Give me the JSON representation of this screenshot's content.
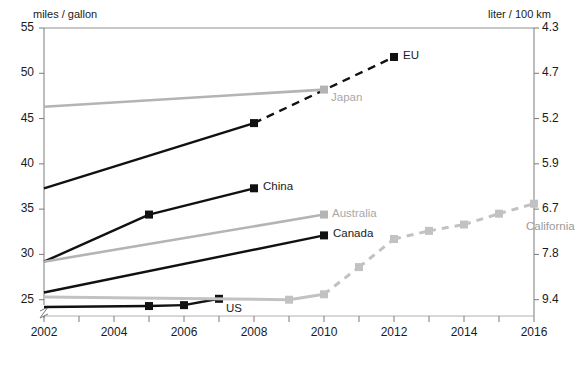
{
  "chart_data": {
    "type": "line",
    "title": "",
    "ylabel": "miles / gallon",
    "ylabel_right": "liter / 100 km",
    "xlabel": "",
    "xlim": [
      2002,
      2016
    ],
    "ylim": [
      23.2,
      55
    ],
    "grid": false,
    "legend": "inline-end-of-line labels",
    "axis_break_left": true,
    "x_ticks_major": [
      "2002",
      "2004",
      "2006",
      "2008",
      "2010",
      "2012",
      "2014",
      "2016"
    ],
    "x_ticks_minor": [
      "2003",
      "2005",
      "2007",
      "2009",
      "2011",
      "2013",
      "2015"
    ],
    "y_ticks_left": [
      "55",
      "50",
      "45",
      "40",
      "35",
      "30",
      "25"
    ],
    "y_ticks_left_values": [
      55,
      50,
      45,
      40,
      35,
      30,
      25
    ],
    "y_ticks_right": [
      "4.3",
      "4.7",
      "5.2",
      "5.9",
      "6.7",
      "7.8",
      "9.4"
    ],
    "y_ticks_right_values": [
      4.3,
      4.7,
      5.2,
      5.9,
      6.7,
      7.8,
      9.4
    ],
    "series": [
      {
        "name": "EU",
        "color": "#111111",
        "style": "solid-then-dashed",
        "label": "EU",
        "x": [
          2002,
          2008,
          2012
        ],
        "values": [
          37.3,
          44.5,
          51.8
        ],
        "markers_at": [
          2008,
          2012
        ],
        "dashed_from": 2008
      },
      {
        "name": "Japan",
        "color": "#b4b4b4",
        "style": "solid",
        "label": "Japan",
        "x": [
          2002,
          2010
        ],
        "values": [
          46.3,
          48.2
        ],
        "markers_at": [
          2010
        ],
        "dashed_from": null
      },
      {
        "name": "China",
        "color": "#111111",
        "style": "solid",
        "label": "China",
        "x": [
          2002,
          2005,
          2008
        ],
        "values": [
          29.2,
          34.4,
          37.3
        ],
        "markers_at": [
          2005,
          2008
        ],
        "dashed_from": null
      },
      {
        "name": "Australia",
        "color": "#b4b4b4",
        "style": "solid",
        "label": "Australia",
        "x": [
          2002,
          2010
        ],
        "values": [
          29.2,
          34.4
        ],
        "markers_at": [
          2010
        ],
        "dashed_from": null
      },
      {
        "name": "Canada",
        "color": "#111111",
        "style": "solid",
        "label": "Canada",
        "x": [
          2002,
          2010
        ],
        "values": [
          25.8,
          32.1
        ],
        "markers_at": [
          2010
        ],
        "dashed_from": null
      },
      {
        "name": "US",
        "color": "#111111",
        "style": "solid",
        "label": "US",
        "x": [
          2002,
          2005,
          2006,
          2007
        ],
        "values": [
          24.2,
          24.3,
          24.4,
          25.1
        ],
        "markers_at": [
          2005,
          2006,
          2007
        ],
        "dashed_from": null
      },
      {
        "name": "California",
        "color": "#c2c2c2",
        "style": "solid-then-dashed",
        "label": "California",
        "x": [
          2002,
          2009,
          2010,
          2011,
          2012,
          2013,
          2014,
          2015,
          2016
        ],
        "values": [
          25.3,
          25.0,
          25.6,
          28.6,
          31.7,
          32.6,
          33.3,
          34.5,
          35.6
        ],
        "markers_at": [
          2009,
          2010,
          2011,
          2012,
          2013,
          2014,
          2015,
          2016
        ],
        "dashed_from": 2010
      }
    ]
  },
  "labels": {
    "left_axis_title": "miles / gallon",
    "right_axis_title": "liter / 100 km",
    "eu": "EU",
    "japan": "Japan",
    "china": "China",
    "australia": "Australia",
    "canada": "Canada",
    "us": "US",
    "california": "California"
  },
  "colors": {
    "dark": "#111111",
    "gray": "#b4b4b4",
    "light_gray": "#c2c2c2",
    "axis": "#7a7a7a",
    "text": "#1a1a1a"
  }
}
